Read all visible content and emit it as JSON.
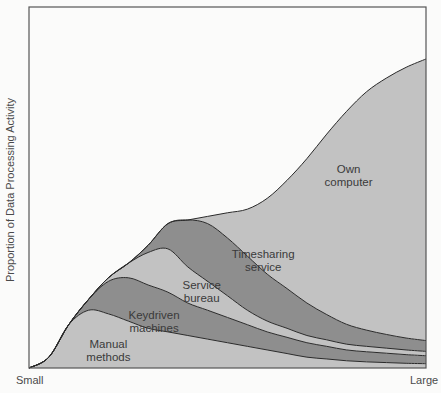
{
  "chart_data": {
    "type": "area",
    "stacked": true,
    "title": "",
    "xlabel_start": "Small",
    "xlabel_end": "Large",
    "ylabel": "Proportion of Data Processing Activity",
    "xlim": [
      0,
      1
    ],
    "ylim": [
      0,
      1
    ],
    "grid": false,
    "legend": "none (labels drawn inside areas)",
    "x": [
      0.0,
      0.05,
      0.1,
      0.15,
      0.2,
      0.25,
      0.3,
      0.35,
      0.4,
      0.45,
      0.5,
      0.55,
      0.6,
      0.65,
      0.7,
      0.75,
      0.8,
      0.85,
      0.9,
      0.95,
      1.0
    ],
    "series": [
      {
        "name": "Manual methods",
        "label_lines": [
          "Manual",
          "methods"
        ],
        "color": "#c2c2c2",
        "values": [
          0.0,
          0.03,
          0.12,
          0.16,
          0.15,
          0.13,
          0.11,
          0.1,
          0.09,
          0.08,
          0.07,
          0.06,
          0.05,
          0.04,
          0.03,
          0.025,
          0.02,
          0.017,
          0.015,
          0.013,
          0.012
        ]
      },
      {
        "name": "Keydriven machines",
        "label_lines": [
          "Keydriven",
          "machines"
        ],
        "color": "#8e8e8e",
        "values": [
          0.0,
          0.0,
          0.0,
          0.03,
          0.09,
          0.12,
          0.12,
          0.11,
          0.09,
          0.08,
          0.07,
          0.06,
          0.05,
          0.045,
          0.04,
          0.035,
          0.03,
          0.028,
          0.026,
          0.024,
          0.022
        ]
      },
      {
        "name": "Service bureau",
        "label_lines": [
          "Service",
          "bureau"
        ],
        "color": "#c2c2c2",
        "values": [
          0.0,
          0.0,
          0.0,
          0.0,
          0.01,
          0.04,
          0.09,
          0.12,
          0.1,
          0.08,
          0.06,
          0.04,
          0.03,
          0.025,
          0.02,
          0.018,
          0.016,
          0.015,
          0.014,
          0.013,
          0.012
        ]
      },
      {
        "name": "Timesharing service",
        "label_lines": [
          "Timesharing",
          "service"
        ],
        "color": "#8e8e8e",
        "values": [
          0.0,
          0.0,
          0.0,
          0.0,
          0.0,
          0.0,
          0.02,
          0.07,
          0.13,
          0.16,
          0.16,
          0.15,
          0.13,
          0.11,
          0.09,
          0.07,
          0.055,
          0.045,
          0.038,
          0.033,
          0.03
        ]
      },
      {
        "name": "Own computer",
        "label_lines": [
          "Own",
          "computer"
        ],
        "color": "#c2c2c2",
        "values": [
          0.0,
          0.0,
          0.0,
          0.0,
          0.0,
          0.0,
          0.0,
          0.0,
          0.0,
          0.02,
          0.07,
          0.13,
          0.21,
          0.3,
          0.4,
          0.5,
          0.59,
          0.66,
          0.71,
          0.75,
          0.78
        ]
      }
    ],
    "label_positions": [
      {
        "series": "Manual methods",
        "x": 0.2,
        "y": 0.055
      },
      {
        "series": "Keydriven machines",
        "x": 0.315,
        "y": 0.135
      },
      {
        "series": "Service bureau",
        "x": 0.435,
        "y": 0.22
      },
      {
        "series": "Timesharing service",
        "x": 0.59,
        "y": 0.305
      },
      {
        "series": "Own computer",
        "x": 0.805,
        "y": 0.54
      }
    ]
  }
}
